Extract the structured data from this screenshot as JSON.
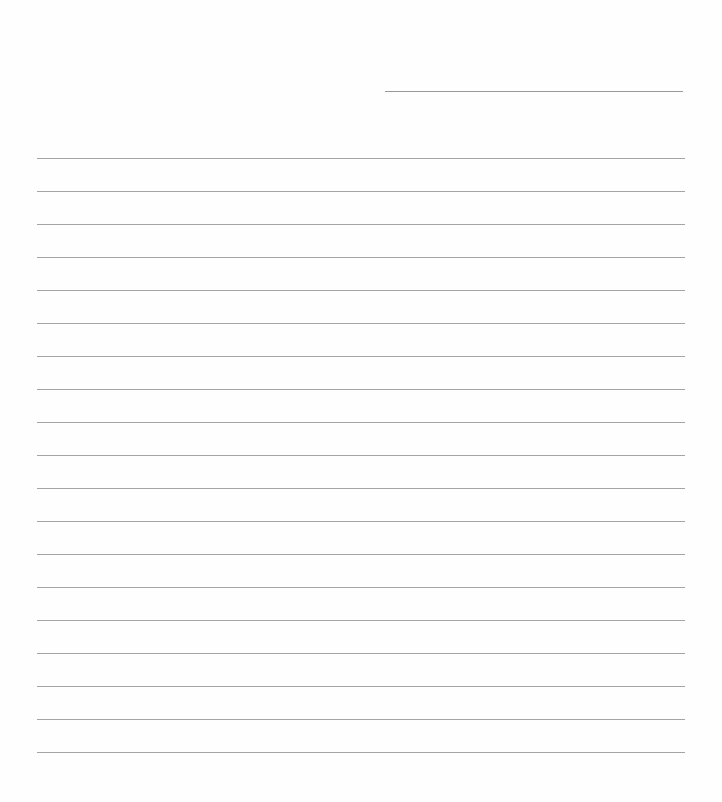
{
  "document": {
    "type": "lined-paper",
    "header_line": {
      "label": ""
    },
    "ruled_lines": {
      "count": 19,
      "first_y": 158,
      "spacing": 33,
      "left": 37,
      "width": 648
    },
    "colors": {
      "paper": "#fefefe",
      "line": "#a4a4a4"
    }
  }
}
